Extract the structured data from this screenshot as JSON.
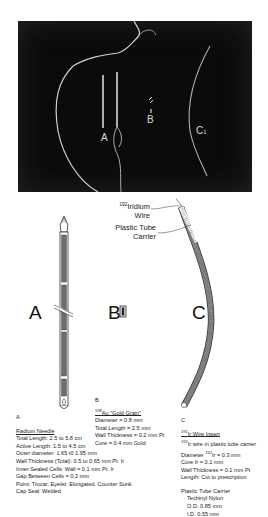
{
  "photo": {
    "labels": {
      "a": "A",
      "b": "B",
      "c": "C",
      "c_sub": "1"
    }
  },
  "diagram": {
    "labels": {
      "a": "A",
      "b": "B",
      "c": "C"
    },
    "callouts": {
      "iridium_wire_sup": "192",
      "iridium_wire_line1": "Iridium",
      "iridium_wire_line2": "Wire",
      "plastic_tube_line1": "Plastic Tube",
      "plastic_tube_line2": "Carrier"
    }
  },
  "specs": {
    "a": {
      "letter": "A",
      "title": "Radium Needle",
      "lines": [
        "Total Length: 2.5 to 5.8 cm",
        "Active Length: 1.5 to 4.5 cm",
        "Outer diameter: 1.65 t0 1.95 mm",
        "Wall Thickness (Total): 0.5 to 0.65 mm Pt. Ir",
        "Inner Sealed Cells: Wall = 0.1 mm Pt. Ir",
        "Gap Between Cells = 0.2 mm",
        "Point: Trocar. Eyelet: Elongated. Counter Sunk",
        "Cap Seal: Welded"
      ]
    },
    "b": {
      "letter": "B",
      "title_sup": "198",
      "title": "Au \"Gold Grain\"",
      "lines": [
        "Diameter = 0.8 mm",
        "Total Length = 2.5 mm",
        "Wall Thickness = 0.2 mm Pt",
        "Core = 0.4 mm Gold"
      ]
    },
    "c": {
      "letter": "C",
      "title_sup": "192",
      "title": "Ir Wire Insert",
      "subtitle_sup": "192",
      "subtitle": "Ir wire in plastic tube carrier",
      "diameter_prefix": "Diameter",
      "diameter_sup": "192",
      "diameter_suffix": "Ir = 0.3 mm",
      "lines": [
        "Core Ir = 0.1 mm",
        "Wall Thickness = 0.1 mm Pt",
        "Length: Cut to prescription"
      ],
      "carrier_title": "Plastic Tube Carrier",
      "carrier_lines": [
        "Techinyl Nylon",
        "O.D. 0.85 mm",
        "I.D. 0.55 mm"
      ]
    }
  }
}
